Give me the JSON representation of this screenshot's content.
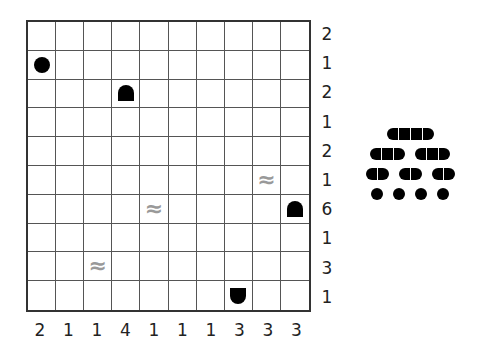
{
  "puzzle": {
    "type": "battleships",
    "size": 10,
    "row_clues": [
      "2",
      "1",
      "2",
      "1",
      "2",
      "1",
      "6",
      "1",
      "3",
      "1"
    ],
    "col_clues": [
      "2",
      "1",
      "1",
      "4",
      "1",
      "1",
      "1",
      "3",
      "3",
      "3"
    ],
    "givens": [
      {
        "row": 1,
        "col": 0,
        "kind": "sub"
      },
      {
        "row": 2,
        "col": 3,
        "kind": "top"
      },
      {
        "row": 5,
        "col": 8,
        "kind": "water"
      },
      {
        "row": 6,
        "col": 4,
        "kind": "water"
      },
      {
        "row": 6,
        "col": 9,
        "kind": "top"
      },
      {
        "row": 8,
        "col": 2,
        "kind": "water"
      },
      {
        "row": 9,
        "col": 7,
        "kind": "bottom"
      }
    ],
    "water_glyph": "≈",
    "fleet": [
      [
        4
      ],
      [
        3,
        3
      ],
      [
        2,
        2,
        2
      ],
      [
        1,
        1,
        1,
        1
      ]
    ]
  }
}
